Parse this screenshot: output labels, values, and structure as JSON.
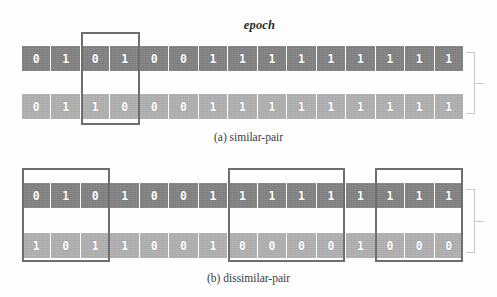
{
  "figure": {
    "epoch_label": "epoch",
    "panels": [
      {
        "id": "similar-pair",
        "caption": "(a) similar-pair",
        "rows": [
          {
            "name": "hash-code-top",
            "shade": "dark",
            "bits": [
              "0",
              "1",
              "0",
              "1",
              "0",
              "0",
              "1",
              "1",
              "1",
              "1",
              "1",
              "1",
              "1",
              "1",
              "1"
            ]
          },
          {
            "name": "hash-code-bottom",
            "shade": "light",
            "bits": [
              "0",
              "1",
              "1",
              "0",
              "0",
              "0",
              "1",
              "1",
              "1",
              "1",
              "1",
              "1",
              "1",
              "1",
              "1"
            ]
          }
        ],
        "highlights": [
          {
            "name": "mismatch-region-1",
            "start_bit": 3,
            "end_bit": 4
          }
        ],
        "brace": {
          "name": "distance-brace",
          "label": ""
        }
      },
      {
        "id": "dissimilar-pair",
        "caption": "(b) dissimilar-pair",
        "rows": [
          {
            "name": "hash-code-top",
            "shade": "dark",
            "bits": [
              "0",
              "1",
              "0",
              "1",
              "0",
              "0",
              "1",
              "1",
              "1",
              "1",
              "1",
              "1",
              "1",
              "1",
              "1"
            ]
          },
          {
            "name": "hash-code-bottom",
            "shade": "light",
            "bits": [
              "1",
              "0",
              "1",
              "1",
              "0",
              "0",
              "1",
              "0",
              "0",
              "0",
              "0",
              "1",
              "0",
              "0",
              "0"
            ]
          }
        ],
        "highlights": [
          {
            "name": "mismatch-region-1",
            "start_bit": 1,
            "end_bit": 3
          },
          {
            "name": "mismatch-region-2",
            "start_bit": 8,
            "end_bit": 11
          },
          {
            "name": "mismatch-region-3",
            "start_bit": 13,
            "end_bit": 15
          }
        ],
        "brace": {
          "name": "distance-brace",
          "label": ""
        }
      }
    ],
    "colors": {
      "bit_dark": "#787878",
      "bit_light": "#a8a8a8",
      "highlight_border": "#6e6e6e",
      "brace": "#c9c9c9",
      "text": "#2b2b2b",
      "background": "#fefefe"
    }
  }
}
